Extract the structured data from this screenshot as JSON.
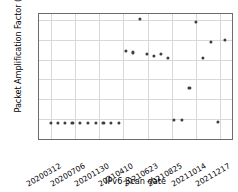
{
  "chart_data": {
    "type": "scatter",
    "title": "",
    "xlabel": "IPv6 Scan date",
    "ylabel": "Packet Amplification Factor (PAF)",
    "ylim": [
      0,
      63
    ],
    "yticks": [
      0,
      10,
      20,
      30,
      40,
      50,
      60
    ],
    "ytick_labels": [
      "0",
      "10",
      "20",
      "30",
      "40",
      "50",
      "60"
    ],
    "xticks": [
      0,
      1,
      2,
      3,
      4,
      5,
      6,
      7
    ],
    "xtick_labels": [
      "20200312",
      "20200706",
      "20201130",
      "20210410",
      "20210623",
      "20210825",
      "20211014",
      "20211217"
    ],
    "xlim": [
      -0.48,
      7.48
    ],
    "grid": true,
    "legend": null,
    "marker": "square-dot",
    "marker_color": "#3e3e3e",
    "points": [
      {
        "x": 0.0,
        "y": 8.0
      },
      {
        "x": 0.3,
        "y": 8.0
      },
      {
        "x": 0.6,
        "y": 8.0
      },
      {
        "x": 0.9,
        "y": 8.0
      },
      {
        "x": 1.22,
        "y": 8.0
      },
      {
        "x": 1.54,
        "y": 8.0
      },
      {
        "x": 1.86,
        "y": 8.0
      },
      {
        "x": 2.18,
        "y": 8.0
      },
      {
        "x": 2.5,
        "y": 8.0
      },
      {
        "x": 2.82,
        "y": 8.0
      },
      {
        "x": 3.12,
        "y": 44.5
      },
      {
        "x": 3.4,
        "y": 43.6
      },
      {
        "x": 3.68,
        "y": 60.5
      },
      {
        "x": 3.98,
        "y": 43.0
      },
      {
        "x": 4.26,
        "y": 41.9
      },
      {
        "x": 4.54,
        "y": 42.8
      },
      {
        "x": 4.84,
        "y": 40.7
      },
      {
        "x": 5.08,
        "y": 9.7
      },
      {
        "x": 5.42,
        "y": 9.7
      },
      {
        "x": 5.72,
        "y": 25.8
      },
      {
        "x": 6.0,
        "y": 59.0
      },
      {
        "x": 6.28,
        "y": 41.0
      },
      {
        "x": 6.62,
        "y": 48.8
      },
      {
        "x": 6.9,
        "y": 8.8
      },
      {
        "x": 7.18,
        "y": 50.1
      }
    ]
  }
}
